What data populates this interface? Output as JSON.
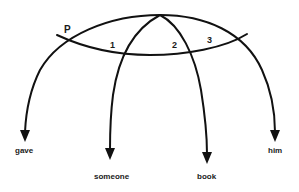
{
  "diagram": {
    "type": "semantic-network",
    "labels": {
      "p": "P",
      "one": "1",
      "two": "2",
      "three": "3",
      "gave": "gave",
      "someone": "someone",
      "book": "book",
      "him": "him"
    },
    "colors": {
      "stroke": "#111111",
      "background": "#ffffff",
      "text": "#1a1a1a"
    }
  }
}
